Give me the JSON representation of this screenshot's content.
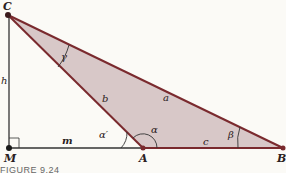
{
  "figure": {
    "caption": "FIGURE 9.24",
    "colors": {
      "triangle_fill": "#d8c8c8",
      "triangle_edge": "#7a2a2e",
      "aux_line": "#333333",
      "background": "#fbfaf6"
    },
    "points": {
      "C": {
        "label": "C",
        "x": 8,
        "y": 15
      },
      "M": {
        "label": "M",
        "x": 9,
        "y": 148
      },
      "A": {
        "label": "A",
        "x": 143,
        "y": 148
      },
      "B": {
        "label": "B",
        "x": 283,
        "y": 148
      }
    },
    "segments": {
      "a": "a",
      "b": "b",
      "c": "c",
      "h": "h",
      "m": "m"
    },
    "angles": {
      "alpha": "α",
      "alpha_prime": "α′",
      "beta": "β",
      "gamma": "γ"
    }
  }
}
